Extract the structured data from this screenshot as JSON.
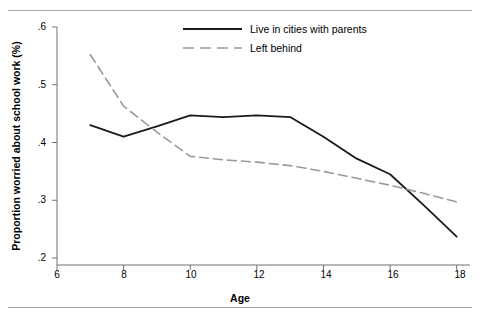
{
  "figure": {
    "title_partial": "",
    "background": "#ffffff",
    "rule_color": "#a8a8a8"
  },
  "legend": {
    "position": "top-center",
    "entries": [
      {
        "label": "Live in cities with parents",
        "style": "solid",
        "color": "#1a1a1a"
      },
      {
        "label": "Left behind",
        "style": "dashed",
        "color": "#9a9a9a"
      }
    ]
  },
  "axes": {
    "x": {
      "label": "Age",
      "ticks": [
        "6",
        "8",
        "10",
        "12",
        "14",
        "16",
        "18"
      ],
      "tick_values": [
        6,
        8,
        10,
        12,
        14,
        16,
        18
      ],
      "min": 6,
      "max": 18.4
    },
    "y": {
      "label": "Proportion worried about school work (%)",
      "ticks": [
        ".2",
        ".3",
        ".4",
        ".5",
        ".6"
      ],
      "tick_values": [
        0.2,
        0.3,
        0.4,
        0.5,
        0.6
      ],
      "min": 0.2,
      "max": 0.6
    }
  },
  "chart_data": {
    "type": "line",
    "title": "",
    "xlabel": "Age",
    "ylabel": "Proportion worried about school work (%)",
    "xlim": [
      6,
      18.4
    ],
    "ylim": [
      0.2,
      0.6
    ],
    "grid": false,
    "legend_position": "top-center",
    "x": [
      7,
      8,
      9,
      10,
      11,
      12,
      13,
      14,
      15,
      16,
      17,
      18
    ],
    "series": [
      {
        "name": "Live in cities with parents",
        "style": "solid",
        "color": "#1a1a1a",
        "values": [
          0.43,
          0.41,
          0.428,
          0.447,
          0.444,
          0.447,
          0.444,
          0.41,
          0.372,
          0.345,
          0.292,
          0.237
        ]
      },
      {
        "name": "Left behind",
        "style": "dashed",
        "color": "#9a9a9a",
        "values": [
          0.552,
          0.463,
          0.418,
          0.376,
          0.37,
          0.366,
          0.36,
          0.35,
          0.338,
          0.326,
          0.312,
          0.297
        ]
      }
    ]
  }
}
